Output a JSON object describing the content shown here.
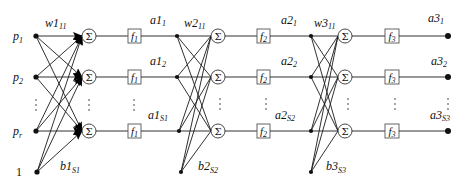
{
  "diagram": {
    "inputs": [
      {
        "base": "p",
        "sub": "1"
      },
      {
        "base": "p",
        "sub": "2"
      },
      {
        "base": "p",
        "sub": "r"
      }
    ],
    "bias_input": "1",
    "sum_symbol": "Σ",
    "layers": [
      {
        "weight_label": {
          "base": "w1",
          "sub": "11"
        },
        "bias_label": {
          "base": "b1",
          "sub": "S1"
        },
        "transfer": {
          "base": "f",
          "sub": "1"
        },
        "outputs": [
          {
            "base": "a1",
            "sub": "1"
          },
          {
            "base": "a1",
            "sub": "2"
          },
          {
            "base": "a1",
            "sub": "S1"
          }
        ]
      },
      {
        "weight_label": {
          "base": "w2",
          "sub": "11"
        },
        "bias_label": {
          "base": "b2",
          "sub": "S2"
        },
        "transfer": {
          "base": "f",
          "sub": "2"
        },
        "outputs": [
          {
            "base": "a2",
            "sub": "1"
          },
          {
            "base": "a2",
            "sub": "2"
          },
          {
            "base": "a2",
            "sub": "S2"
          }
        ]
      },
      {
        "weight_label": {
          "base": "w3",
          "sub": "11"
        },
        "bias_label": {
          "base": "b3",
          "sub": "S3"
        },
        "transfer": {
          "base": "f",
          "sub": "3"
        },
        "outputs": [
          {
            "base": "a3",
            "sub": "1"
          },
          {
            "base": "a3",
            "sub": "2"
          },
          {
            "base": "a3",
            "sub": "S3"
          }
        ]
      }
    ],
    "ellipsis": "⋮"
  }
}
